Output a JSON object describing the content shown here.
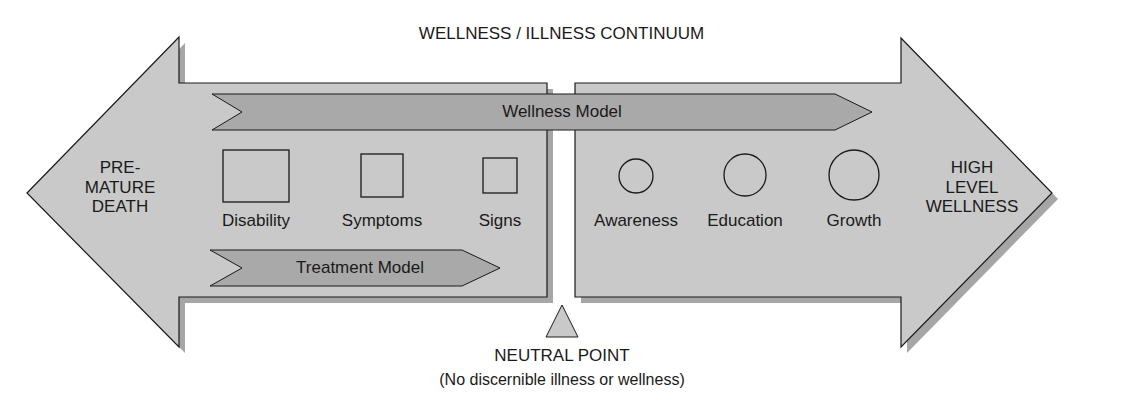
{
  "title": "WELLNESS / ILLNESS CONTINUUM",
  "left_arrow": {
    "label_lines": [
      "PRE-",
      "MATURE",
      "DEATH"
    ],
    "fill": "#c9c9c9"
  },
  "right_arrow": {
    "label_lines": [
      "HIGH",
      "LEVEL",
      "WELLNESS"
    ],
    "fill": "#c9c9c9"
  },
  "wellness_model": {
    "label": "Wellness Model",
    "fill": "#a9a9a9"
  },
  "treatment_model": {
    "label": "Treatment Model",
    "fill": "#a9a9a9"
  },
  "illness_items": [
    {
      "label": "Disability",
      "shape": "square",
      "size": "large"
    },
    {
      "label": "Symptoms",
      "shape": "square",
      "size": "medium"
    },
    {
      "label": "Signs",
      "shape": "square",
      "size": "small"
    }
  ],
  "wellness_items": [
    {
      "label": "Awareness",
      "shape": "circle",
      "size": "small"
    },
    {
      "label": "Education",
      "shape": "circle",
      "size": "medium"
    },
    {
      "label": "Growth",
      "shape": "circle",
      "size": "large"
    }
  ],
  "neutral_point": {
    "label": "NEUTRAL POINT",
    "sublabel": "(No discernible illness or wellness)",
    "fill": "#c9c9c9"
  },
  "colors": {
    "arrow_fill": "#c9c9c9",
    "arrow_shadow": "#a6a6a6",
    "bar_fill": "#a9a9a9",
    "stroke": "#1a1a1a"
  }
}
